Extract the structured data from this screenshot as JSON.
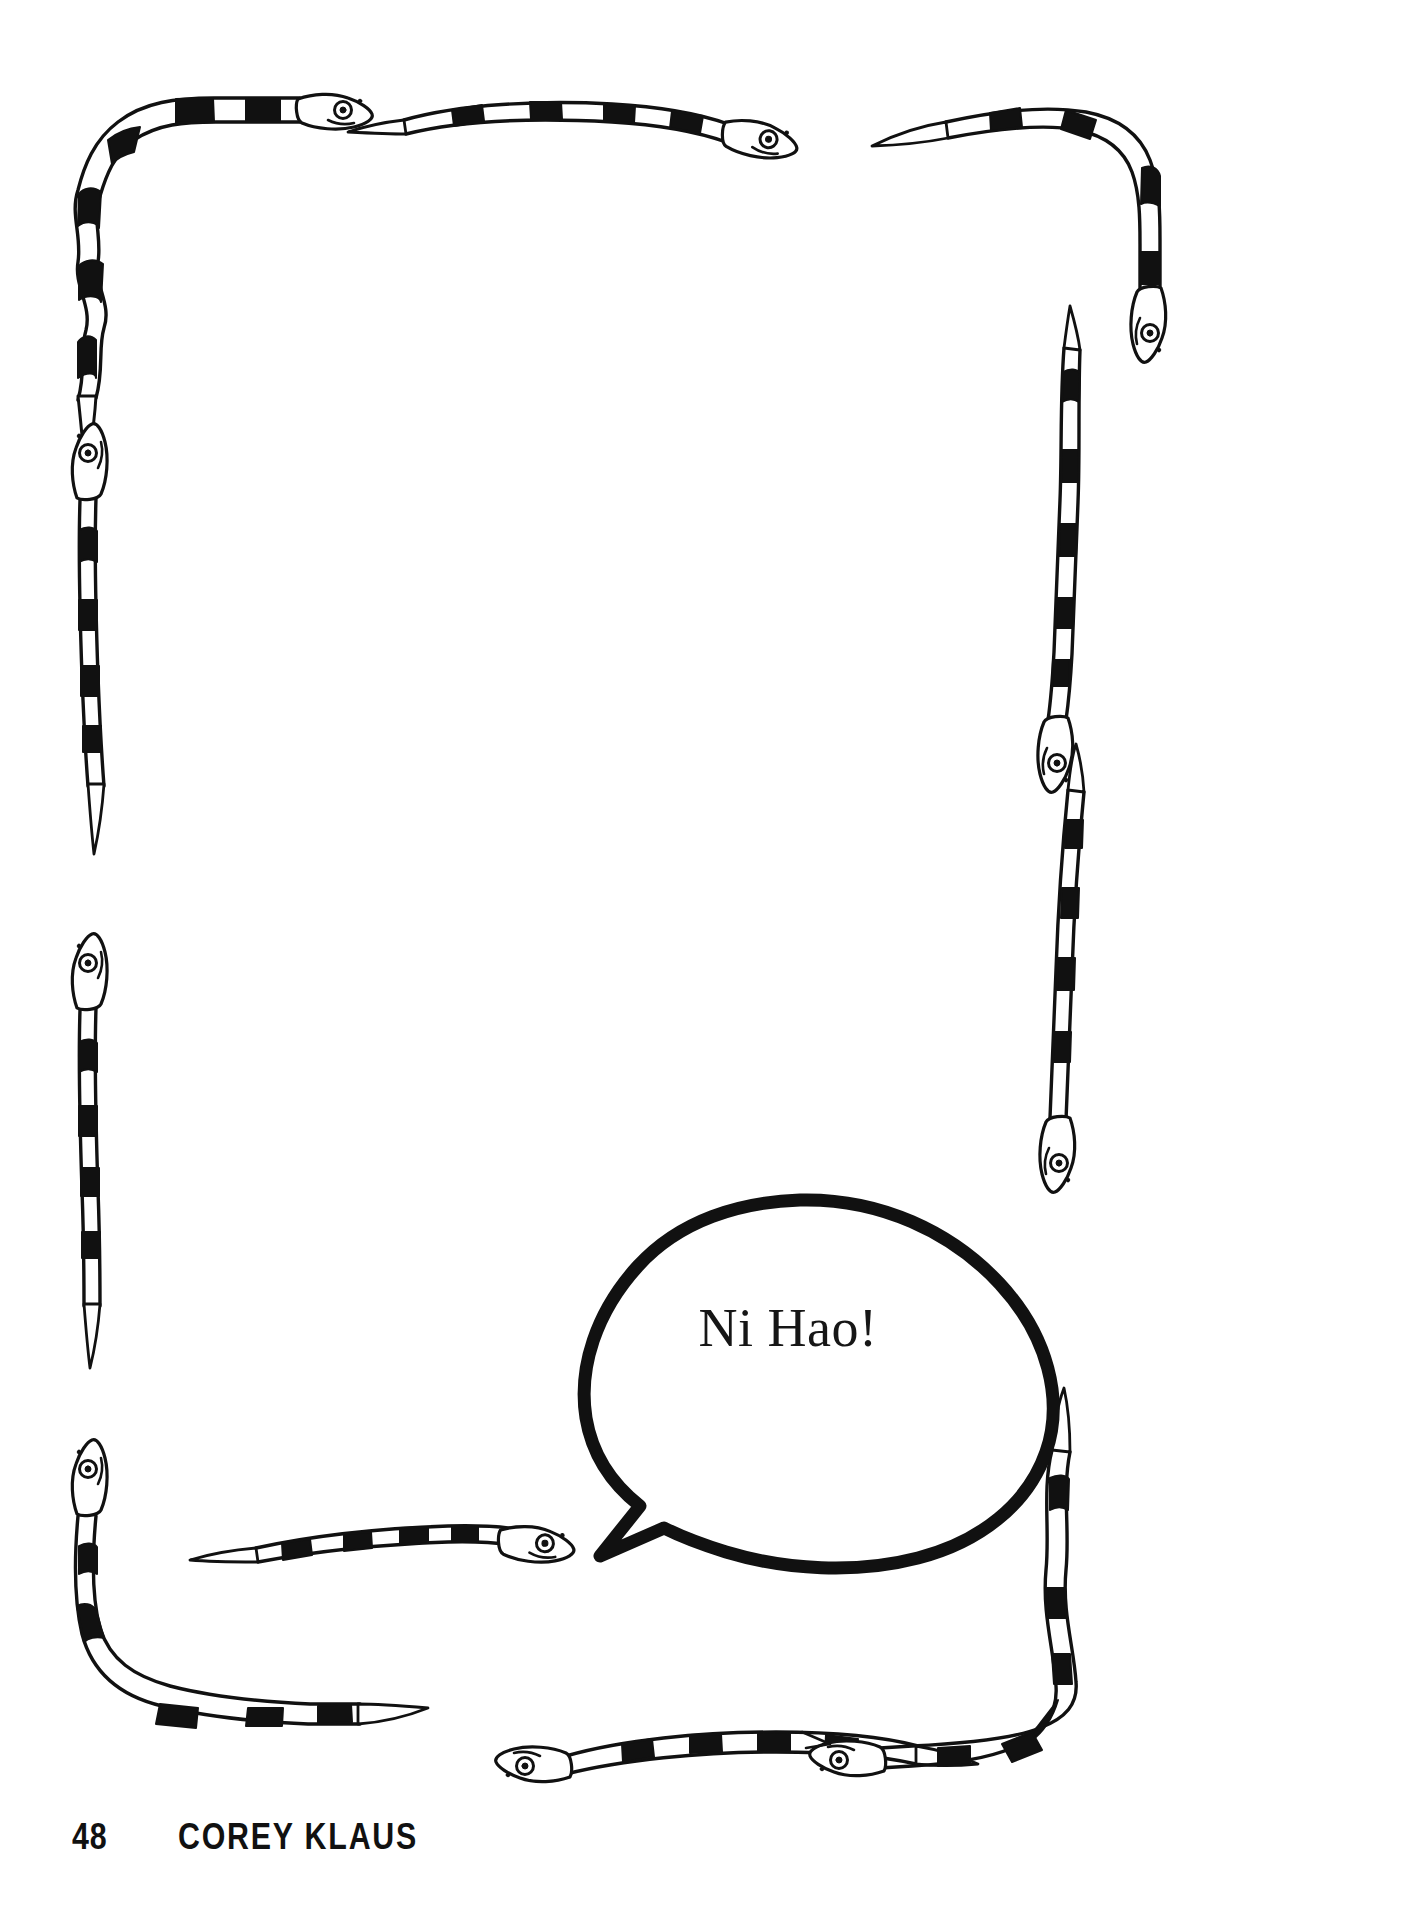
{
  "page": {
    "kind": "illustrated-book-page",
    "background_color": "#ffffff",
    "ink_color": "#111111",
    "width": 1403,
    "height": 1914
  },
  "speech_bubble": {
    "text": "Ni Hao!",
    "shape": "oval-with-pointed-tail",
    "tail_direction": "left-down",
    "outline_color": "#111111",
    "fill_color": "#ffffff"
  },
  "footer": {
    "page_number": "48",
    "running_head": "COREY KLAUS"
  },
  "border_art": {
    "motif": "banded-snakes",
    "description": "Decorative page border formed of black-and-white banded snakes",
    "band_color": "#111111",
    "body_color": "#ffffff",
    "snake_count": 10,
    "snakes": [
      {
        "id": "top-left-corner-snake",
        "position": "top-left",
        "head": "right",
        "bands": 7
      },
      {
        "id": "top-center-snake",
        "position": "top-center",
        "head": "right",
        "bands": 5
      },
      {
        "id": "top-right-corner-snake",
        "position": "top-right",
        "head": "down",
        "bands": 6
      },
      {
        "id": "left-upper-snake",
        "position": "left-upper",
        "head": "up",
        "bands": 6
      },
      {
        "id": "left-lower-snake",
        "position": "left-lower",
        "head": "up",
        "bands": 7
      },
      {
        "id": "right-middle-snake",
        "position": "right-middle",
        "head": "down",
        "bands": 7
      },
      {
        "id": "bottom-left-corner-snake",
        "position": "bottom-left",
        "head": "up",
        "bands": 7
      },
      {
        "id": "bottom-center-left-snake",
        "position": "bottom-center-left",
        "head": "right",
        "bands": 6
      },
      {
        "id": "bottom-center-right-snake",
        "position": "bottom-center-right",
        "head": "left",
        "bands": 6
      },
      {
        "id": "bottom-right-corner-snake",
        "position": "bottom-right",
        "head": "left",
        "bands": 7
      }
    ]
  }
}
